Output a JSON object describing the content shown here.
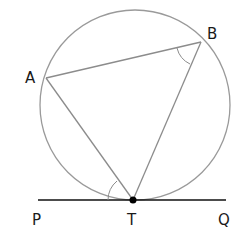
{
  "diagram": {
    "colors": {
      "circle": "#9a9a9a",
      "chord": "#8c8c8c",
      "tangent": "#111111",
      "point": "#000000",
      "label": "#1a1a1a"
    },
    "labels": {
      "A": "A",
      "B": "B",
      "P": "P",
      "T": "T",
      "Q": "Q"
    },
    "points": {
      "A": [
        46,
        78
      ],
      "B": [
        201,
        42
      ],
      "T": [
        133,
        200
      ],
      "P": [
        38,
        200
      ],
      "Q": [
        226,
        200
      ]
    },
    "circle": {
      "cx": 135,
      "cy": 105,
      "r": 95
    },
    "angle_marks": [
      "angle ABT at B",
      "angle ATP at T"
    ]
  }
}
